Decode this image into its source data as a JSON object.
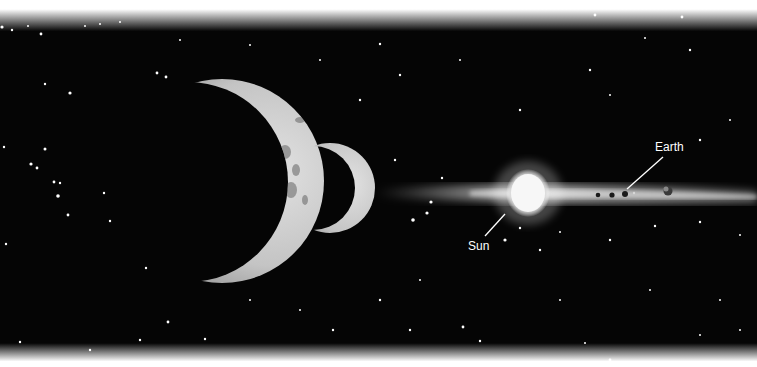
{
  "illustration": {
    "subject": "Solar system viewed edge-on with two crescent moons in foreground",
    "labels": {
      "earth": "Earth",
      "sun": "Sun"
    },
    "colors": {
      "space": "#030303",
      "fade": "#ffffff",
      "moon_lit": "#cfcfcf",
      "sun_glow": "#f4f4f4",
      "label_text": "#ffffff"
    }
  }
}
